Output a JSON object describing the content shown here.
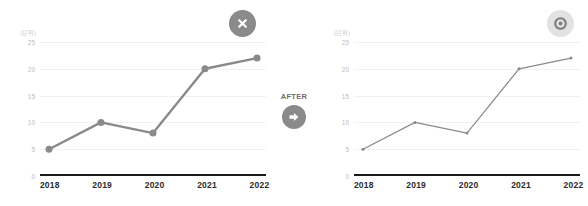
{
  "before": {
    "badge_icon": "close-x-icon",
    "badge_color": "#8a8a8a",
    "unit_label": "(단위)"
  },
  "after": {
    "badge_icon": "circle-o-icon",
    "badge_color": "#e2e2e2",
    "unit_label": "(단위)"
  },
  "transition": {
    "label": "AFTER",
    "arrow_icon": "arrow-right-icon",
    "arrow_color": "#8a8a8a"
  },
  "chart_data": [
    {
      "type": "line",
      "id": "before",
      "title": "",
      "xlabel": "",
      "ylabel": "(단위)",
      "categories": [
        "2018",
        "2019",
        "2020",
        "2021",
        "2022"
      ],
      "values": [
        5,
        10,
        8,
        20,
        22
      ],
      "yticks": [
        "25",
        "20",
        "15",
        "10",
        "5",
        "0"
      ],
      "ylim": [
        0,
        25
      ],
      "grid": true,
      "legend": "none",
      "line_color": "#8a8a8a",
      "line_width": 2.4,
      "marker": "circle",
      "marker_size": 7,
      "axis_color": "#1a1a1a"
    },
    {
      "type": "line",
      "id": "after",
      "title": "",
      "xlabel": "",
      "ylabel": "(단위)",
      "categories": [
        "2018",
        "2019",
        "2020",
        "2021",
        "2022"
      ],
      "values": [
        5,
        10,
        8,
        20,
        22
      ],
      "yticks": [
        "25",
        "20",
        "15",
        "10",
        "5",
        "0"
      ],
      "ylim": [
        0,
        25
      ],
      "grid": true,
      "legend": "none",
      "line_color": "#8a8a8a",
      "line_width": 1.2,
      "marker": "circle",
      "marker_size": 3,
      "axis_color": "#1a1a1a"
    }
  ]
}
